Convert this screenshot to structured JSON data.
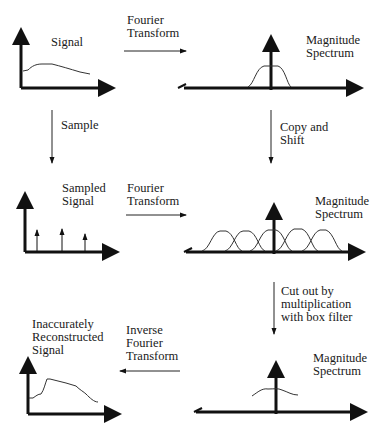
{
  "labels": {
    "signal": "Signal",
    "ft1": "Fourier\nTransform",
    "mag1": "Magnitude\nSpectrum",
    "sample": "Sample",
    "copy_shift": "Copy and\nShift",
    "sampled_signal": "Sampled\nSignal",
    "ft2": "Fourier\nTransform",
    "mag2": "Magnitude\nSpectrum",
    "cut_out": "Cut out by\nmultiplication\nwith box filter",
    "reconstructed": "Inaccurately\nReconstructed\nSignal",
    "ift": "Inverse\nFourier\nTransform",
    "mag3": "Magnitude\nSpectrum"
  },
  "colors": {
    "ink": "#111111",
    "background": "#ffffff"
  }
}
